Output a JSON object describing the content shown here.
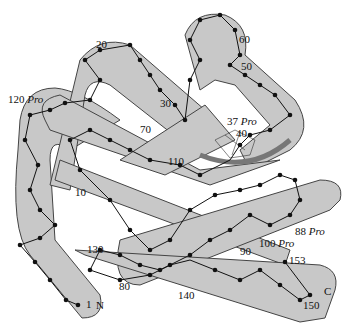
{
  "diagram": {
    "type": "protein backbone ribbon diagram (myoglobin-like, with heme group)",
    "residue_labels": [
      {
        "text": "1",
        "x": 86,
        "y": 308
      },
      {
        "text": "10",
        "x": 75,
        "y": 196
      },
      {
        "text": "20",
        "x": 96,
        "y": 48
      },
      {
        "text": "30",
        "x": 160,
        "y": 107
      },
      {
        "text": "40",
        "x": 236,
        "y": 137
      },
      {
        "text": "50",
        "x": 241,
        "y": 70
      },
      {
        "text": "60",
        "x": 239,
        "y": 43
      },
      {
        "text": "70",
        "x": 140,
        "y": 133
      },
      {
        "text": "80",
        "x": 119,
        "y": 290
      },
      {
        "text": "90",
        "x": 240,
        "y": 255
      },
      {
        "text": "110",
        "x": 168,
        "y": 165
      },
      {
        "text": "130",
        "x": 87,
        "y": 253
      },
      {
        "text": "140",
        "x": 178,
        "y": 299
      },
      {
        "text": "150",
        "x": 303,
        "y": 309
      },
      {
        "text": "153",
        "x": 285,
        "y": 262
      }
    ],
    "pro_labels": [
      {
        "num": "120",
        "tag": "Pro",
        "x": 8,
        "y": 103
      },
      {
        "num": "37",
        "tag": "Pro",
        "x": 227,
        "y": 125
      },
      {
        "num": "88",
        "tag": "Pro",
        "x": 295,
        "y": 235
      },
      {
        "num": "100",
        "tag": "Pro",
        "x": 259,
        "y": 247
      }
    ],
    "terminus_labels": [
      {
        "text": "N",
        "x": 96,
        "y": 309
      },
      {
        "text": "C",
        "x": 324,
        "y": 295
      }
    ],
    "colors": {
      "tube_fill": "#c8c8c8",
      "tube_stroke": "#444444",
      "chain": "#111111",
      "heme_arc": "#777777"
    }
  }
}
